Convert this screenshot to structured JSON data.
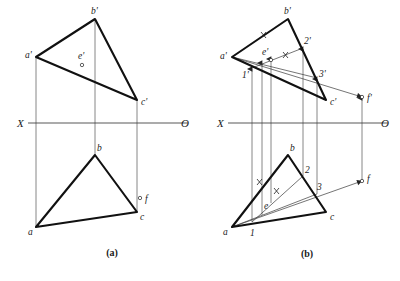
{
  "figure": {
    "captions": [
      {
        "text": "(a)",
        "x": 112,
        "y": 256
      },
      {
        "text": "(b)",
        "x": 307,
        "y": 257
      }
    ],
    "axis_labels": {
      "left": "X",
      "right": "O"
    },
    "colors": {
      "ink": "#111111",
      "thin_ink": "#3a3a3a",
      "paper": "#ffffff"
    },
    "line_widths": {
      "thick": 2.1,
      "thin": 0.7,
      "axis": 0.85
    }
  },
  "panel_a": {
    "name": "panel-a",
    "axis": {
      "x1": 28,
      "y1": 123,
      "x2": 188,
      "y2": 123,
      "label_left": "X",
      "label_right": "O",
      "label_left_x": 17,
      "label_left_y": 127,
      "label_right_x": 181,
      "label_right_y": 127
    },
    "front_view": {
      "points": {
        "a_prime": {
          "x": 36,
          "y": 57,
          "label": "a'",
          "label_x": 25,
          "label_y": 57
        },
        "b_prime": {
          "x": 95,
          "y": 19,
          "label": "b'",
          "label_x": 92,
          "label_y": 13
        },
        "c_prime": {
          "x": 137,
          "y": 100,
          "label": "c'",
          "label_x": 141,
          "label_y": 103
        },
        "e_prime": {
          "x": 82,
          "y": 63,
          "label": "e'",
          "label_x": 78,
          "label_y": 57
        }
      },
      "triangle": "a'-b'-c'"
    },
    "top_view": {
      "points": {
        "a": {
          "x": 36,
          "y": 227,
          "label": "a",
          "label_x": 29,
          "label_y": 233
        },
        "b": {
          "x": 95,
          "y": 155,
          "label": "b",
          "label_x": 98,
          "label_y": 150
        },
        "c": {
          "x": 137,
          "y": 212,
          "label": "c",
          "label_x": 141,
          "label_y": 219
        },
        "f": {
          "x": 141,
          "y": 199,
          "label": "f",
          "label_x": 146,
          "label_y": 201
        }
      },
      "triangle": "a-b-c"
    },
    "projectors": [
      {
        "x": 36,
        "y1": 57,
        "y2": 227
      },
      {
        "x": 95,
        "y1": 19,
        "y2": 155
      },
      {
        "x": 137,
        "y1": 100,
        "y2": 212
      }
    ]
  },
  "panel_b": {
    "name": "panel-b",
    "axis": {
      "x1": 228,
      "y1": 123,
      "x2": 388,
      "y2": 123,
      "label_left": "X",
      "label_right": "O",
      "label_left_x": 217,
      "label_left_y": 127,
      "label_right_x": 381,
      "label_right_y": 127
    },
    "front_view": {
      "points": {
        "a_prime": {
          "x": 232,
          "y": 57,
          "label": "a'",
          "label_x": 221,
          "label_y": 58
        },
        "b_prime": {
          "x": 288,
          "y": 19,
          "label": "b'",
          "label_x": 285,
          "label_y": 13
        },
        "c_prime": {
          "x": 326,
          "y": 100,
          "label": "c'",
          "label_x": 331,
          "label_y": 103
        },
        "e_prime": {
          "x": 271,
          "y": 58,
          "label": "e'",
          "label_x": 264,
          "label_y": 53
        },
        "one_prime": {
          "x": 252,
          "y": 68,
          "label": "1'",
          "label_x": 243,
          "label_y": 76
        },
        "two_prime": {
          "x": 303,
          "y": 48,
          "label": "2'",
          "label_x": 304,
          "label_y": 43
        },
        "three_prime": {
          "x": 317,
          "y": 78,
          "label": "3'",
          "label_x": 320,
          "label_y": 77
        },
        "f_prime": {
          "x": 362,
          "y": 97,
          "label": "f'",
          "label_x": 367,
          "label_y": 100
        }
      }
    },
    "top_view": {
      "points": {
        "a": {
          "x": 232,
          "y": 227,
          "label": "a",
          "label_x": 224,
          "label_y": 233
        },
        "b": {
          "x": 288,
          "y": 155,
          "label": "b",
          "label_x": 291,
          "label_y": 150
        },
        "c": {
          "x": 326,
          "y": 212,
          "label": "c",
          "label_x": 331,
          "label_y": 219
        },
        "e": {
          "x": 271,
          "y": 203,
          "label": "e",
          "label_x": 265,
          "label_y": 207
        },
        "one": {
          "x": 252,
          "y": 222,
          "label": "1",
          "label_x": 252,
          "label_y": 233
        },
        "two": {
          "x": 303,
          "y": 176,
          "label": "2",
          "label_x": 306,
          "label_y": 172
        },
        "three": {
          "x": 317,
          "y": 194,
          "label": "3",
          "label_x": 318,
          "label_y": 188
        },
        "f": {
          "x": 362,
          "y": 181,
          "label": "f",
          "label_x": 367,
          "label_y": 180
        }
      }
    },
    "projectors": [
      {
        "x": 252,
        "y1": 68,
        "y2": 222,
        "arrow": "up"
      },
      {
        "x": 262,
        "y1": 62,
        "y2": 215,
        "arrow": "up"
      },
      {
        "x": 271,
        "y1": 58,
        "y2": 203,
        "arrow": "up"
      },
      {
        "x": 303,
        "y1": 48,
        "y2": 176,
        "arrow": "up"
      },
      {
        "x": 317,
        "y1": 78,
        "y2": 194,
        "arrow": "up"
      },
      {
        "x": 362,
        "y1": 97,
        "y2": 181,
        "arrow": "up"
      }
    ],
    "tick_marks": [
      {
        "cx": 264,
        "cy": 35,
        "label": "x"
      },
      {
        "cx": 288,
        "cy": 55,
        "label": "x"
      },
      {
        "cx": 260,
        "cy": 182,
        "label": "x"
      },
      {
        "cx": 278,
        "cy": 191,
        "label": "x"
      }
    ],
    "direction_arrows": [
      {
        "from_x": 336,
        "from_y": 92,
        "to_x": 352,
        "to_y": 96,
        "name": "arrow-ef-front"
      },
      {
        "from_x": 336,
        "from_y": 186,
        "to_x": 352,
        "to_y": 182,
        "name": "arrow-ef-top"
      }
    ]
  }
}
